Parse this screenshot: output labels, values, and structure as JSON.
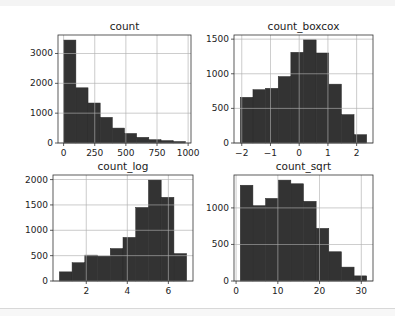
{
  "figure": {
    "bar_color": "#333333",
    "grid_color": "#b0b0b0",
    "background": "#ffffff"
  },
  "chart_data": [
    {
      "type": "bar",
      "title": "count",
      "xlabel": "",
      "ylabel": "",
      "bin_edges": [
        1,
        98.6,
        196.2,
        293.8,
        391.4,
        489,
        586.6,
        684.2,
        781.8,
        879.4,
        977
      ],
      "values": [
        3450,
        1850,
        1340,
        860,
        500,
        320,
        190,
        110,
        80,
        50
      ],
      "xlim": [
        -45,
        1023
      ],
      "ylim": [
        0,
        3620
      ],
      "xticks": [
        0,
        250,
        500,
        750,
        1000
      ],
      "xtick_labels": [
        "0",
        "250",
        "500",
        "750",
        "1000"
      ],
      "yticks": [
        0,
        1000,
        2000,
        3000
      ],
      "ytick_labels": [
        "0",
        "1000",
        "2000",
        "3000"
      ],
      "grid": true
    },
    {
      "type": "bar",
      "title": "count_boxcox",
      "xlabel": "",
      "ylabel": "",
      "bin_edges": [
        -2.05,
        -1.61,
        -1.17,
        -0.73,
        -0.29,
        0.15,
        0.59,
        1.03,
        1.47,
        1.91,
        2.35
      ],
      "values": [
        660,
        770,
        790,
        960,
        1310,
        1490,
        1300,
        850,
        410,
        120
      ],
      "xlim": [
        -2.27,
        2.57
      ],
      "ylim": [
        0,
        1560
      ],
      "xticks": [
        -2,
        -1,
        0,
        1,
        2
      ],
      "xtick_labels": [
        "−2",
        "−1",
        "0",
        "1",
        "2"
      ],
      "yticks": [
        0,
        500,
        1000,
        1500
      ],
      "ytick_labels": [
        "0",
        "500",
        "1000",
        "1500"
      ],
      "grid": true
    },
    {
      "type": "bar",
      "title": "count_log",
      "xlabel": "",
      "ylabel": "",
      "bin_edges": [
        0.69,
        1.31,
        1.93,
        2.55,
        3.17,
        3.79,
        4.41,
        5.03,
        5.65,
        6.27,
        6.89
      ],
      "values": [
        180,
        360,
        510,
        490,
        640,
        860,
        1450,
        1990,
        1650,
        540
      ],
      "xlim": [
        0.38,
        7.2
      ],
      "ylim": [
        0,
        2090
      ],
      "xticks": [
        2,
        4,
        6
      ],
      "xtick_labels": [
        "2",
        "4",
        "6"
      ],
      "yticks": [
        0,
        500,
        1000,
        1500,
        2000
      ],
      "ytick_labels": [
        "0",
        "500",
        "1000",
        "1500",
        "2000"
      ],
      "grid": true
    },
    {
      "type": "bar",
      "title": "count_sqrt",
      "xlabel": "",
      "ylabel": "",
      "bin_edges": [
        1,
        4.03,
        7.06,
        10.09,
        13.12,
        16.15,
        19.18,
        22.21,
        25.24,
        28.27,
        31.3
      ],
      "values": [
        1310,
        1030,
        1130,
        1380,
        1330,
        1090,
        720,
        400,
        190,
        70
      ],
      "xlim": [
        -0.5,
        32.8
      ],
      "ylim": [
        0,
        1450
      ],
      "xticks": [
        0,
        10,
        20,
        30
      ],
      "xtick_labels": [
        "0",
        "10",
        "20",
        "30"
      ],
      "yticks": [
        0,
        500,
        1000
      ],
      "ytick_labels": [
        "0",
        "500",
        "1000"
      ],
      "grid": true
    }
  ]
}
